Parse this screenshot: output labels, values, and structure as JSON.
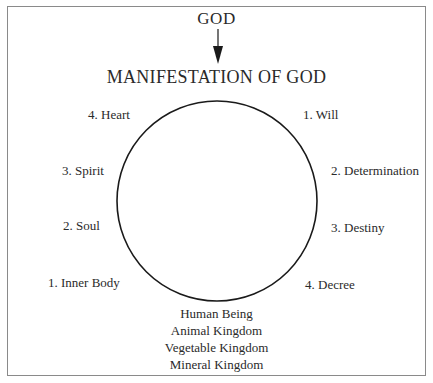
{
  "diagram": {
    "source_label": "GOD",
    "title": "MANIFESTATION OF GOD",
    "arrow": {
      "direction": "down",
      "from": "GOD",
      "to": "MANIFESTATION OF GOD"
    },
    "circle": {
      "cx": 217,
      "cy": 201,
      "r": 100,
      "stroke": "#1a1a1a"
    },
    "left_labels": [
      {
        "label": "4. Heart"
      },
      {
        "label": "3. Spirit"
      },
      {
        "label": "2. Soul"
      },
      {
        "label": "1. Inner Body"
      }
    ],
    "right_labels": [
      {
        "label": "1. Will"
      },
      {
        "label": "2. Determination"
      },
      {
        "label": "3. Destiny"
      },
      {
        "label": "4. Decree"
      }
    ],
    "bottom_labels": [
      {
        "label": "Human Being"
      },
      {
        "label": "Animal Kingdom"
      },
      {
        "label": "Vegetable Kingdom"
      },
      {
        "label": "Mineral Kingdom"
      }
    ],
    "colors": {
      "text": "#2a2a2a",
      "line": "#1a1a1a",
      "frame": "#8a8a8a",
      "background": "#ffffff"
    }
  }
}
